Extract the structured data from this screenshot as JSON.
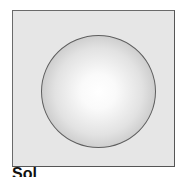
{
  "figure": {
    "caption": "Sol",
    "colors": {
      "background": "#e6e6e6",
      "frame_border": "#6a6a6a",
      "sphere_highlight": "#ffffff",
      "sphere_edge": "#acacac",
      "sphere_outline": "#5e5e5e"
    }
  }
}
